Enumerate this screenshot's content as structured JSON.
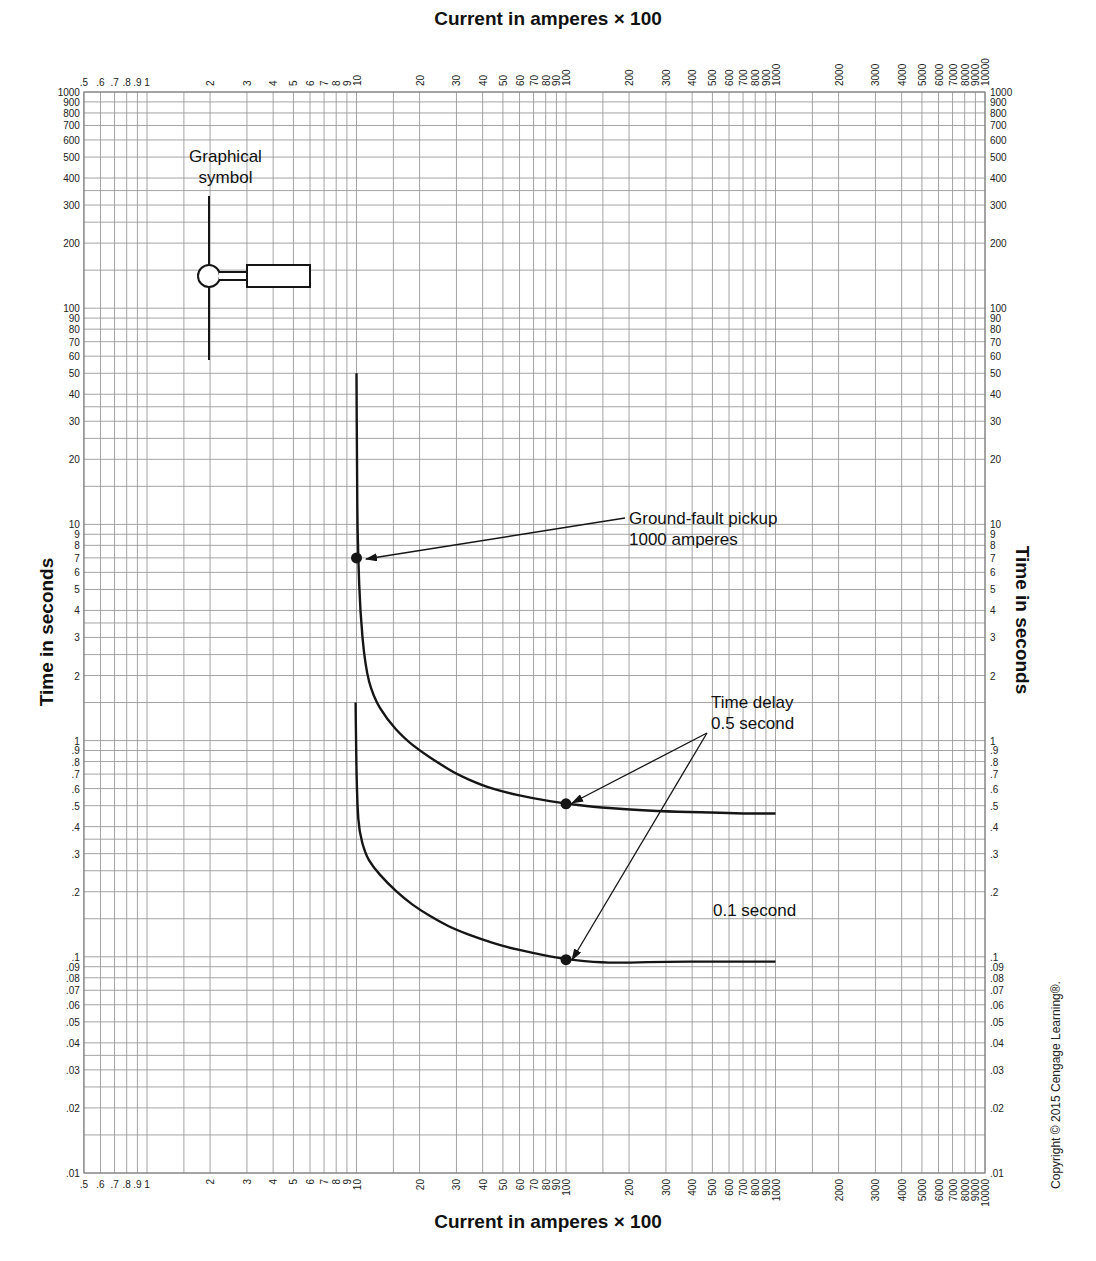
{
  "chart_data": {
    "type": "line",
    "xlabel": "Current in amperes × 100",
    "ylabel": "Time in seconds",
    "xscale": "log",
    "yscale": "log",
    "xlim": [
      0.5,
      10000
    ],
    "ylim": [
      0.01,
      1000
    ],
    "grid": true,
    "x_tick_labels": [
      ".5",
      ".6",
      ".7",
      ".8",
      ".9",
      "1",
      "2",
      "3",
      "4",
      "5",
      "6",
      "7",
      "8",
      "9",
      "10",
      "20",
      "30",
      "40",
      "50",
      "60",
      "70",
      "80",
      "90",
      "100",
      "200",
      "300",
      "400",
      "500",
      "600",
      "700",
      "800",
      "900",
      "1000",
      "2000",
      "3000",
      "4000",
      "5000",
      "6000",
      "7000",
      "8000",
      "9000",
      "10000"
    ],
    "x_tick_values": [
      0.5,
      0.6,
      0.7,
      0.8,
      0.9,
      1,
      2,
      3,
      4,
      5,
      6,
      7,
      8,
      9,
      10,
      20,
      30,
      40,
      50,
      60,
      70,
      80,
      90,
      100,
      200,
      300,
      400,
      500,
      600,
      700,
      800,
      900,
      1000,
      2000,
      3000,
      4000,
      5000,
      6000,
      7000,
      8000,
      9000,
      10000
    ],
    "y_tick_labels": [
      "1000",
      "900",
      "800",
      "700",
      "600",
      "500",
      "400",
      "300",
      "200",
      "100",
      "90",
      "80",
      "70",
      "60",
      "50",
      "40",
      "30",
      "20",
      "10",
      "9",
      "8",
      "7",
      "6",
      "5",
      "4",
      "3",
      "2",
      "1",
      ".9",
      ".8",
      ".7",
      ".6",
      ".5",
      ".4",
      ".3",
      ".2",
      ".1",
      ".09",
      ".08",
      ".07",
      ".06",
      ".05",
      ".04",
      ".03",
      ".02",
      ".01"
    ],
    "y_tick_values": [
      1000,
      900,
      800,
      700,
      600,
      500,
      400,
      300,
      200,
      100,
      90,
      80,
      70,
      60,
      50,
      40,
      30,
      20,
      10,
      9,
      8,
      7,
      6,
      5,
      4,
      3,
      2,
      1,
      0.9,
      0.8,
      0.7,
      0.6,
      0.5,
      0.4,
      0.3,
      0.2,
      0.1,
      0.09,
      0.08,
      0.07,
      0.06,
      0.05,
      0.04,
      0.03,
      0.02,
      0.01
    ],
    "series": [
      {
        "name": "Time delay 0.5 second",
        "x": [
          10,
          10.05,
          10.1,
          10.2,
          10.4,
          11,
          12,
          14,
          17,
          20,
          25,
          30,
          40,
          50,
          70,
          100,
          150,
          200,
          300,
          500,
          700,
          1000
        ],
        "y": [
          50,
          20,
          10,
          7,
          4,
          2.2,
          1.6,
          1.25,
          1.02,
          0.9,
          0.78,
          0.7,
          0.62,
          0.58,
          0.54,
          0.51,
          0.49,
          0.48,
          0.47,
          0.465,
          0.46,
          0.46
        ]
      },
      {
        "name": "Time delay 0.1 second",
        "x": [
          9.9,
          9.95,
          10.0,
          10.1,
          10.3,
          11,
          12,
          14,
          17,
          20,
          25,
          30,
          40,
          50,
          70,
          100,
          150,
          200,
          300,
          500,
          700,
          1000
        ],
        "y": [
          1.5,
          1.0,
          0.7,
          0.5,
          0.38,
          0.3,
          0.26,
          0.22,
          0.185,
          0.165,
          0.145,
          0.133,
          0.12,
          0.112,
          0.104,
          0.097,
          0.094,
          0.094,
          0.095,
          0.095,
          0.095,
          0.095
        ]
      }
    ],
    "markers": [
      {
        "name": "ground-fault-pickup-point",
        "x": 10,
        "y": 7
      },
      {
        "name": "time-delay-0.5-point",
        "x": 100,
        "y": 0.51
      },
      {
        "name": "time-delay-0.1-point",
        "x": 100,
        "y": 0.097
      }
    ],
    "annotations": [
      {
        "text": "Ground-fault pickup\n1000 amperes",
        "points_to": {
          "x": 10,
          "y": 7
        }
      },
      {
        "text": "Time delay\n0.5 second",
        "points_to": [
          {
            "x": 100,
            "y": 0.51
          },
          {
            "x": 100,
            "y": 0.097
          }
        ]
      },
      {
        "text": "0.1 second"
      },
      {
        "text": "Graphical\nsymbol"
      }
    ]
  },
  "labels": {
    "top_axis_title": "Current in amperes × 100",
    "bottom_axis_title": "Current in amperes × 100",
    "left_axis_title": "Time in seconds",
    "right_axis_title": "Time in seconds",
    "graphical_symbol_line1": "Graphical",
    "graphical_symbol_line2": "symbol",
    "pickup_line1": "Ground-fault pickup",
    "pickup_line2": "1000 amperes",
    "delay_line1": "Time delay",
    "delay_line2": "0.5 second",
    "delay_01": "0.1 second",
    "copyright": "Copyright © 2015 Cengage Learning®."
  },
  "colors": {
    "grid": "#9a9a9a",
    "curve": "#151515",
    "text": "#111111"
  }
}
